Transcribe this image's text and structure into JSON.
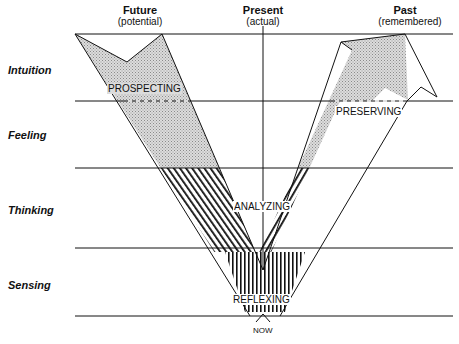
{
  "columns": {
    "future": {
      "title": "Future",
      "subtitle": "(potential)"
    },
    "present": {
      "title": "Present",
      "subtitle": "(actual)"
    },
    "past": {
      "title": "Past",
      "subtitle": "(remembered)"
    }
  },
  "rows": [
    {
      "label": "Intuition"
    },
    {
      "label": "Feeling"
    },
    {
      "label": "Thinking"
    },
    {
      "label": "Sensing"
    }
  ],
  "bands": {
    "prospecting": "PROSPECTING",
    "preserving": "PRESERVING",
    "analyzing": "ANALYZING",
    "reflexing": "REFLEXING"
  },
  "now_label": "NOW",
  "colors": {
    "line": "#111111",
    "dot_fill": "#cfcfcf",
    "background": "#ffffff"
  }
}
